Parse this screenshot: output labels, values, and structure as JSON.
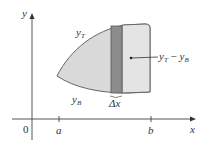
{
  "diagram": {
    "axes": {
      "x_label": "x",
      "y_label": "y",
      "origin_label": "0",
      "ticks": [
        {
          "label": "a"
        },
        {
          "label": "b"
        }
      ]
    },
    "curves": {
      "top": {
        "base": "y",
        "sub": "T"
      },
      "bottom": {
        "base": "y",
        "sub": "B"
      }
    },
    "strip": {
      "width_label": "Δx",
      "height_label": {
        "base1": "y",
        "sub1": "T",
        "minus": " − ",
        "base2": "y",
        "sub2": "B"
      }
    },
    "colors": {
      "region_fill": "#d9d9d9",
      "strip_fill": "#8c8c8c",
      "right_strip_fill": "#e3e3e3",
      "stroke": "#555555"
    }
  }
}
